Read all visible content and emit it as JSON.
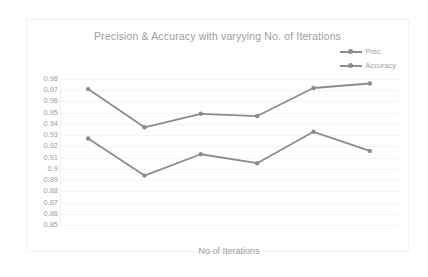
{
  "chart_data": {
    "type": "line",
    "title": "Precision & Accuracy with varyying No. of Iterations",
    "xlabel": "No of Iterations",
    "ylabel": "",
    "ylim": [
      0.85,
      0.98
    ],
    "ytick_labels": [
      "0.98",
      "0.97",
      "0.96",
      "0.95",
      "0.94",
      "0.93",
      "0.92",
      "0.91",
      "0.9",
      "0.89",
      "0.88",
      "0.87",
      "0.86",
      "0.85"
    ],
    "ytick_values": [
      0.98,
      0.97,
      0.96,
      0.95,
      0.94,
      0.93,
      0.92,
      0.91,
      0.9,
      0.89,
      0.88,
      0.87,
      0.86,
      0.85
    ],
    "x": [
      1,
      2,
      3,
      4,
      5,
      6
    ],
    "categories": [
      "",
      "",
      "",
      "",
      "",
      ""
    ],
    "grid": true,
    "legend_position": "top-right",
    "series": [
      {
        "name": "Prec.",
        "color": "#8c8c8c",
        "values": [
          0.927,
          0.894,
          0.913,
          0.905,
          0.933,
          0.916
        ]
      },
      {
        "name": "Accuracy",
        "color": "#8c8c8c",
        "values": [
          0.971,
          0.937,
          0.949,
          0.947,
          0.972,
          0.976
        ]
      }
    ]
  },
  "legend": {
    "items": [
      {
        "label": "Prec."
      },
      {
        "label": "Accuracy"
      }
    ]
  }
}
